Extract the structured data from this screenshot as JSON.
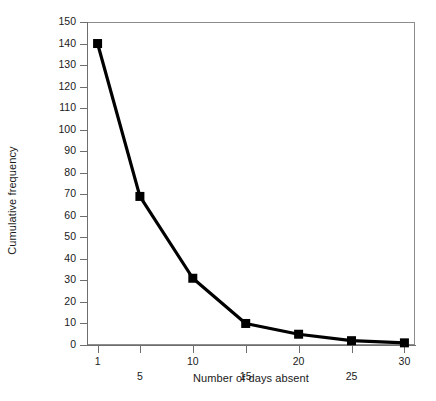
{
  "chart_data": {
    "type": "line",
    "title": "",
    "xlabel": "Number of days absent",
    "ylabel": "Cumulative frequency",
    "x": [
      1,
      5,
      10,
      15,
      20,
      25,
      30
    ],
    "values": [
      140,
      69,
      31,
      10,
      5,
      2,
      1
    ],
    "series": [
      {
        "name": "Cumulative frequency",
        "values": [
          140,
          69,
          31,
          10,
          5,
          2,
          1
        ]
      }
    ],
    "xlim": [
      0,
      31
    ],
    "ylim": [
      0,
      150
    ],
    "x_ticks": [
      1,
      5,
      10,
      15,
      20,
      25,
      30
    ],
    "x_tick_labels": [
      "1",
      "5",
      "10",
      "15",
      "20",
      "25",
      "30"
    ],
    "y_ticks": [
      0,
      10,
      20,
      30,
      40,
      50,
      60,
      70,
      80,
      90,
      100,
      110,
      120,
      130,
      140,
      150
    ],
    "y_tick_labels": [
      "0",
      "10",
      "20",
      "30",
      "40",
      "50",
      "60",
      "70",
      "80",
      "90",
      "100",
      "110",
      "120",
      "130",
      "140",
      "150"
    ],
    "grid": false,
    "legend": "none",
    "marker": "square",
    "marker_color": "#000000",
    "line_color": "#000000",
    "frame_color": "#8d8d8d",
    "background_color": "#ffffff"
  }
}
